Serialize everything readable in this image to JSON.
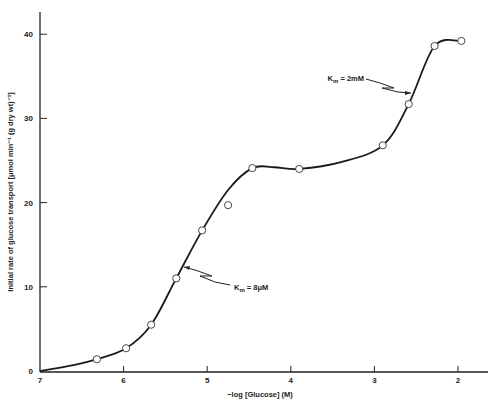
{
  "chart_data": {
    "type": "line",
    "title": "",
    "xlabel": "−log [Glucose] (M)",
    "ylabel": "Initial rate of glucose transport [μmol min⁻¹ (g dry wt)⁻¹]",
    "xlim": [
      7,
      2
    ],
    "ylim": [
      0,
      42
    ],
    "x_reversed": true,
    "grid": false,
    "x_ticks": [
      "7",
      "6",
      "5",
      "4",
      "3",
      "2"
    ],
    "y_ticks": [
      "0",
      "10",
      "20",
      "30",
      "40"
    ],
    "series": [
      {
        "name": "Measured glucose transport",
        "marker": "open-circle",
        "x": [
          6.32,
          5.97,
          5.67,
          5.37,
          5.06,
          4.75,
          4.46,
          3.9,
          2.9,
          2.59,
          2.28,
          1.96
        ],
        "values": [
          1.4,
          2.7,
          5.5,
          11.0,
          16.7,
          19.7,
          24.1,
          24.0,
          26.8,
          31.7,
          38.6,
          39.2
        ]
      },
      {
        "name": "Fitted curve",
        "marker": "none",
        "x": [
          7.0,
          6.6,
          6.32,
          5.97,
          5.67,
          5.37,
          5.06,
          4.75,
          4.46,
          4.2,
          3.9,
          3.4,
          2.9,
          2.59,
          2.28,
          1.96
        ],
        "values": [
          0.0,
          0.7,
          1.4,
          2.7,
          5.5,
          11.0,
          16.7,
          21.5,
          24.1,
          24.2,
          24.0,
          24.8,
          26.8,
          31.7,
          38.6,
          39.2
        ]
      }
    ],
    "annotations": [
      {
        "text_main": "K",
        "text_sub": "m",
        "text_rest": " = 8μM",
        "points_to_x": 5.35,
        "points_to_y": 12.0
      },
      {
        "text_main": "K",
        "text_sub": "m",
        "text_rest": " = 2mM",
        "points_to_x": 2.55,
        "points_to_y": 33.5
      }
    ]
  }
}
